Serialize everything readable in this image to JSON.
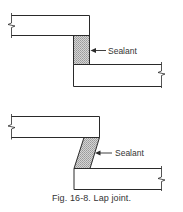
{
  "figure": {
    "caption": "Fig. 16-8. Lap joint.",
    "number": "16-8",
    "title": "Lap joint"
  },
  "diagrams": [
    {
      "id": "lap-joint-square",
      "description": "Lap joint with rectangular sealant bead between overlapping plates",
      "sealant_label": "Sealant",
      "sealant_shape": "rectangle",
      "colors": {
        "line": "#2a2a2a",
        "sealant_fill": "#bdbdbd"
      }
    },
    {
      "id": "lap-joint-angled",
      "description": "Lap joint with angled (parallelogram) sealant bead between offset plates",
      "sealant_label": "Sealant",
      "sealant_shape": "parallelogram",
      "colors": {
        "line": "#2a2a2a",
        "sealant_fill": "#bdbdbd"
      }
    }
  ]
}
